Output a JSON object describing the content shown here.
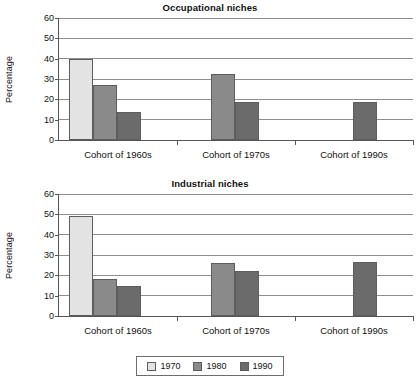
{
  "chart_data": [
    {
      "type": "bar",
      "title": "Occupational niches",
      "xlabel": "",
      "ylabel": "Percentage",
      "ylim": [
        0,
        60
      ],
      "yticks": [
        0,
        10,
        20,
        30,
        40,
        50,
        60
      ],
      "grid": true,
      "legend_position": "bottom",
      "categories": [
        "Cohort of 1960s",
        "Cohort of 1970s",
        "Cohort of 1990s"
      ],
      "series": [
        {
          "name": "1970",
          "color": "#e3e3e3",
          "values": [
            40,
            null,
            null
          ]
        },
        {
          "name": "1980",
          "color": "#8a8a8a",
          "values": [
            27,
            32.5,
            null
          ]
        },
        {
          "name": "1990",
          "color": "#6b6b6b",
          "values": [
            14,
            18.5,
            18.5
          ]
        }
      ]
    },
    {
      "type": "bar",
      "title": "Industrial niches",
      "xlabel": "",
      "ylabel": "Percentage",
      "ylim": [
        0,
        60
      ],
      "yticks": [
        0,
        10,
        20,
        30,
        40,
        50,
        60
      ],
      "grid": true,
      "legend_position": "bottom",
      "categories": [
        "Cohort of 1960s",
        "Cohort of 1970s",
        "Cohort of 1990s"
      ],
      "series": [
        {
          "name": "1970",
          "color": "#e3e3e3",
          "values": [
            49,
            null,
            null
          ]
        },
        {
          "name": "1980",
          "color": "#8a8a8a",
          "values": [
            18,
            26,
            null
          ]
        },
        {
          "name": "1990",
          "color": "#6b6b6b",
          "values": [
            15,
            22,
            26.5
          ]
        }
      ]
    }
  ],
  "charts": {
    "occupational": {
      "title": "Occupational niches",
      "ylabel": "Percentage",
      "yticks": [
        "60",
        "50",
        "40",
        "30",
        "20",
        "10",
        "0"
      ],
      "categories": [
        "Cohort of 1960s",
        "Cohort of 1970s",
        "Cohort of 1990s"
      ]
    },
    "industrial": {
      "title": "Industrial niches",
      "ylabel": "Percentage",
      "yticks": [
        "60",
        "50",
        "40",
        "30",
        "20",
        "10",
        "0"
      ],
      "categories": [
        "Cohort of 1960s",
        "Cohort of 1970s",
        "Cohort of 1990s"
      ]
    }
  },
  "legend": {
    "items": [
      {
        "label": "1970",
        "color": "#e3e3e3"
      },
      {
        "label": "1980",
        "color": "#8a8a8a"
      },
      {
        "label": "1990",
        "color": "#6b6b6b"
      }
    ]
  }
}
